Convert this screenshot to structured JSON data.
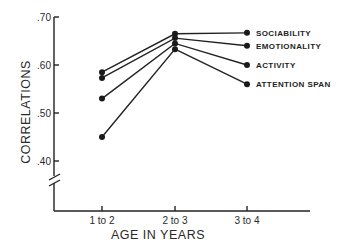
{
  "chart_data": {
    "type": "line",
    "title": "",
    "xlabel": "AGE IN YEARS",
    "ylabel": "CORRELATIONS",
    "categories": [
      "1 to 2",
      "2 to 3",
      "3 to 4"
    ],
    "y_ticks": [
      0.4,
      0.5,
      0.6,
      0.7
    ],
    "y_tick_labels": [
      ".40",
      ".50",
      ".60",
      ".70"
    ],
    "ylim": [
      0.4,
      0.7
    ],
    "y_axis_break": true,
    "grid": false,
    "legend_placement": "right, labels at line ends",
    "series": [
      {
        "name": "SOCIABILITY",
        "values": [
          0.585,
          0.665,
          0.667
        ]
      },
      {
        "name": "EMOTIONALITY",
        "values": [
          0.573,
          0.656,
          0.64
        ]
      },
      {
        "name": "ACTIVITY",
        "values": [
          0.53,
          0.645,
          0.6
        ]
      },
      {
        "name": "ATTENTION SPAN",
        "values": [
          0.45,
          0.633,
          0.56
        ]
      }
    ]
  }
}
